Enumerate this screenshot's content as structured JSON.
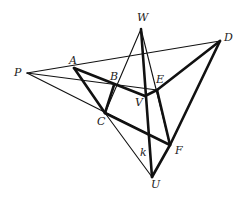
{
  "diagram": {
    "type": "projective-geometry-figure",
    "points": {
      "P": [
        27,
        73
      ],
      "A": [
        74,
        68
      ],
      "B": [
        114,
        85
      ],
      "C": [
        105,
        113
      ],
      "W": [
        141,
        29
      ],
      "D": [
        220,
        41
      ],
      "E": [
        157,
        90
      ],
      "V": [
        145,
        96
      ],
      "F": [
        170,
        145
      ],
      "U": [
        152,
        177
      ],
      "K": [
        146,
        137
      ]
    },
    "labels": [
      {
        "text": "P",
        "x": 14,
        "y": 67
      },
      {
        "text": "A",
        "x": 69,
        "y": 55
      },
      {
        "text": "B",
        "x": 110,
        "y": 71
      },
      {
        "text": "C",
        "x": 97,
        "y": 116
      },
      {
        "text": "W",
        "x": 137,
        "y": 12
      },
      {
        "text": "D",
        "x": 224,
        "y": 32
      },
      {
        "text": "E",
        "x": 156,
        "y": 74
      },
      {
        "text": "V",
        "x": 135,
        "y": 97
      },
      {
        "text": "F",
        "x": 175,
        "y": 145
      },
      {
        "text": "U",
        "x": 151,
        "y": 179
      },
      {
        "text": "k",
        "x": 140,
        "y": 147
      }
    ],
    "thin_lines": [
      [
        "P",
        "D"
      ],
      [
        "P",
        "E"
      ],
      [
        "P",
        "F"
      ],
      [
        "C",
        "U"
      ],
      [
        "W",
        "C"
      ],
      [
        "W",
        "F"
      ]
    ],
    "thick_lines": [
      [
        "A",
        "C"
      ],
      [
        "A",
        "V"
      ],
      [
        "B",
        "C"
      ],
      [
        "V",
        "E"
      ],
      [
        "E",
        "D"
      ],
      [
        "E",
        "F"
      ],
      [
        "D",
        "F"
      ],
      [
        "F",
        "U"
      ],
      [
        "W",
        "U"
      ],
      [
        "C",
        "F"
      ]
    ]
  }
}
